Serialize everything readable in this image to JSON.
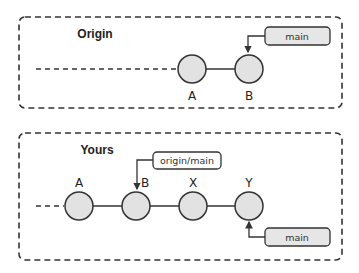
{
  "diagram": {
    "panels": [
      {
        "id": "origin",
        "title": "Origin",
        "commits": [
          {
            "label": "A"
          },
          {
            "label": "B"
          }
        ],
        "refs": [
          {
            "label": "main",
            "points_to": "B"
          }
        ]
      },
      {
        "id": "yours",
        "title": "Yours",
        "commits": [
          {
            "label": "A"
          },
          {
            "label": "B"
          },
          {
            "label": "X"
          },
          {
            "label": "Y"
          }
        ],
        "refs": [
          {
            "label": "origin/main",
            "points_to": "B"
          },
          {
            "label": "main",
            "points_to": "Y"
          }
        ]
      }
    ],
    "colors": {
      "commit_fill": "#e2e2e2",
      "stroke": "#333333",
      "ref_fill": "#e6e6e6"
    }
  }
}
